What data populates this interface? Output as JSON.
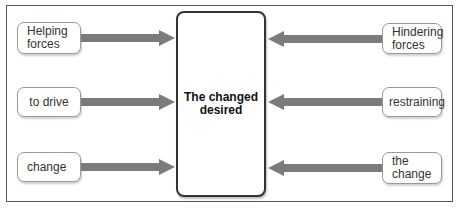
{
  "diagram": {
    "type": "force-field-analysis",
    "center": {
      "label": "The changed desired"
    },
    "left_boxes": [
      {
        "label": "Helping forces"
      },
      {
        "label": "to drive"
      },
      {
        "label": "change"
      }
    ],
    "right_boxes": [
      {
        "label": "Hindering forces"
      },
      {
        "label": "restraining"
      },
      {
        "label": "the change"
      }
    ],
    "arrow_color": "#7b7b7b",
    "left_arrows_direction": "right",
    "right_arrows_direction": "left"
  }
}
